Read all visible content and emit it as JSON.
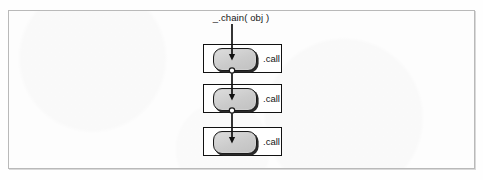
{
  "figure": {
    "name": "underscore-chain-diagram",
    "entry_label": "_.chain( obj )",
    "colors": {
      "frame_border": "#b9b9b9",
      "unit_border": "#111111",
      "call_fill": "#cfcfcf",
      "call_border": "#1a1a1a",
      "connector_line": "#111111",
      "text": "#141414",
      "page_background": "#fdfdfd"
    },
    "units": [
      {
        "id": "call-unit-1",
        "label": ".call",
        "has_exit_connector": true
      },
      {
        "id": "call-unit-2",
        "label": ".call",
        "has_exit_connector": true
      },
      {
        "id": "call-unit-3",
        "label": ".call",
        "has_exit_connector": false
      }
    ]
  }
}
